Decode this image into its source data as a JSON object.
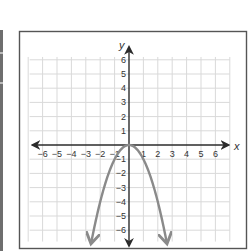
{
  "chart_data": {
    "type": "line",
    "title": "",
    "xlabel": "x",
    "ylabel": "y",
    "xlim": [
      -6,
      6
    ],
    "ylim": [
      -6,
      6
    ],
    "grid": true,
    "x_ticks": [
      -6,
      -5,
      -4,
      -3,
      -2,
      -1,
      1,
      2,
      3,
      4,
      5,
      6
    ],
    "y_ticks": [
      6,
      5,
      4,
      3,
      2,
      1,
      -1,
      -2,
      -3,
      -4,
      -5,
      -6
    ],
    "x_tick_labels": [
      "−6",
      "−5",
      "−4",
      "−3",
      "−2",
      "−1",
      "1",
      "2",
      "3",
      "4",
      "5",
      "6"
    ],
    "y_tick_labels": [
      "6",
      "5",
      "4",
      "3",
      "2",
      "1",
      "−1",
      "−2",
      "−3",
      "−4",
      "−5",
      "−6"
    ],
    "series": [
      {
        "name": "y = -x^2",
        "equation": "y = -x^2",
        "vertex": [
          0,
          0
        ],
        "x": [
          -2.6,
          -2,
          -1,
          0,
          1,
          2,
          2.6
        ],
        "y": [
          -6.76,
          -4,
          -1,
          0,
          -1,
          -4,
          -6.76
        ],
        "arrows_at_ends": true,
        "color": "#8a8a8a"
      }
    ],
    "colors": {
      "axis": "#2b2b2b",
      "grid": "#d9d9d9",
      "frame": "#555555",
      "curve": "#8a8a8a"
    }
  }
}
